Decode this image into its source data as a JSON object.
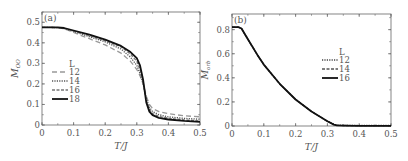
{
  "chart_data": [
    {
      "type": "line",
      "panel": "(a)",
      "xlabel": "T/J",
      "ylabel": "M_OO",
      "xlim": [
        0,
        0.5
      ],
      "ylim": [
        0,
        0.55
      ],
      "xticks": [
        "0",
        "0.1",
        "0.2",
        "0.3",
        "0.4",
        "0.5"
      ],
      "yticks": [
        "0",
        "0.1",
        "0.2",
        "0.3",
        "0.4",
        "0.5"
      ],
      "legend_title": "L",
      "legend_position": "center-left",
      "x": [
        0,
        0.02,
        0.05,
        0.07,
        0.1,
        0.15,
        0.2,
        0.25,
        0.28,
        0.3,
        0.31,
        0.32,
        0.33,
        0.34,
        0.35,
        0.37,
        0.4,
        0.45,
        0.5
      ],
      "series": [
        {
          "name": "12",
          "style": "long-dash",
          "color": "#999999",
          "values": [
            0.475,
            0.475,
            0.474,
            0.468,
            0.45,
            0.42,
            0.39,
            0.35,
            0.31,
            0.27,
            0.24,
            0.2,
            0.14,
            0.1,
            0.08,
            0.065,
            0.055,
            0.045,
            0.04
          ]
        },
        {
          "name": "14",
          "style": "dotted",
          "color": "#555555",
          "values": [
            0.475,
            0.475,
            0.474,
            0.469,
            0.455,
            0.43,
            0.405,
            0.37,
            0.33,
            0.29,
            0.25,
            0.2,
            0.13,
            0.085,
            0.065,
            0.05,
            0.04,
            0.032,
            0.028
          ]
        },
        {
          "name": "16",
          "style": "dashed",
          "color": "#777777",
          "values": [
            0.475,
            0.475,
            0.474,
            0.47,
            0.457,
            0.435,
            0.41,
            0.38,
            0.345,
            0.31,
            0.27,
            0.21,
            0.12,
            0.075,
            0.055,
            0.042,
            0.033,
            0.025,
            0.02
          ]
        },
        {
          "name": "18",
          "style": "solid",
          "color": "#111111",
          "values": [
            0.475,
            0.475,
            0.475,
            0.472,
            0.46,
            0.44,
            0.415,
            0.385,
            0.355,
            0.325,
            0.29,
            0.22,
            0.11,
            0.065,
            0.048,
            0.035,
            0.027,
            0.02,
            0.015
          ]
        }
      ]
    },
    {
      "type": "line",
      "panel": "(b)",
      "xlabel": "T/J",
      "ylabel": "M_orb",
      "xlim": [
        0,
        0.5
      ],
      "ylim": [
        0,
        0.93
      ],
      "xticks": [
        "0",
        "0.1",
        "0.2",
        "0.3",
        "0.4",
        "0.5"
      ],
      "yticks": [
        "0",
        "0.2",
        "0.4",
        "0.6",
        "0.8"
      ],
      "legend_title": "L",
      "legend_position": "center-right",
      "x": [
        0,
        0.02,
        0.03,
        0.05,
        0.08,
        0.1,
        0.15,
        0.2,
        0.25,
        0.3,
        0.32,
        0.33,
        0.35,
        0.4,
        0.45,
        0.5
      ],
      "series": [
        {
          "name": "12",
          "style": "dotted",
          "color": "#444444",
          "values": [
            0.82,
            0.82,
            0.81,
            0.72,
            0.59,
            0.51,
            0.35,
            0.22,
            0.12,
            0.04,
            0.015,
            0.008,
            0.006,
            0.005,
            0.004,
            0.004
          ]
        },
        {
          "name": "14",
          "style": "dashed",
          "color": "#555555",
          "values": [
            0.82,
            0.82,
            0.81,
            0.72,
            0.59,
            0.51,
            0.35,
            0.22,
            0.12,
            0.04,
            0.013,
            0.006,
            0.004,
            0.003,
            0.003,
            0.003
          ]
        },
        {
          "name": "16",
          "style": "solid",
          "color": "#111111",
          "values": [
            0.82,
            0.82,
            0.81,
            0.72,
            0.59,
            0.51,
            0.35,
            0.22,
            0.12,
            0.04,
            0.012,
            0.005,
            0.003,
            0.002,
            0.002,
            0.002
          ]
        }
      ]
    }
  ]
}
